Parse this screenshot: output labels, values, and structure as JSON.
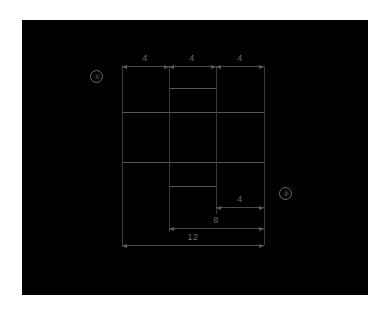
{
  "page": {
    "background": "#ffffff",
    "canvas_background": "#000000",
    "line_color": "#555555",
    "text_color": "#6a6a6a"
  },
  "drawing": {
    "title": "orthographic cross / plus shaped part outline",
    "units": "unitless",
    "shapes": [
      {
        "name": "horizontal-rectangle",
        "x": 100,
        "y": 92,
        "w": 142,
        "h": 50,
        "width_units": 12,
        "height_units": 4
      },
      {
        "name": "vertical-rectangle",
        "x": 147,
        "y": 68,
        "w": 47,
        "h": 98,
        "width_units": 4,
        "height_units": 8
      }
    ],
    "extension_lines": [
      {
        "name": "ext-left",
        "x": 100,
        "y1": 46,
        "y2": 225
      },
      {
        "name": "ext-mid-left",
        "x": 147,
        "y1": 46,
        "y2": 212
      },
      {
        "name": "ext-mid-right",
        "x": 194,
        "y1": 46,
        "y2": 194
      },
      {
        "name": "ext-right",
        "x": 242,
        "y1": 46,
        "y2": 225
      }
    ],
    "dimensions": [
      {
        "id": "top-seg-1",
        "label": "4",
        "value": 4,
        "orientation": "horizontal",
        "x1": 100,
        "x2": 147,
        "y": 46,
        "text_x": 123,
        "text_y": 33
      },
      {
        "id": "top-seg-2",
        "label": "4",
        "value": 4,
        "orientation": "horizontal",
        "x1": 147,
        "x2": 194,
        "y": 46,
        "text_x": 170,
        "text_y": 33
      },
      {
        "id": "top-seg-3",
        "label": "4",
        "value": 4,
        "orientation": "horizontal",
        "x1": 194,
        "x2": 242,
        "y": 46,
        "text_x": 218,
        "text_y": 33
      },
      {
        "id": "bottom-right-4",
        "label": "4",
        "value": 4,
        "orientation": "horizontal",
        "x1": 194,
        "x2": 242,
        "y": 187,
        "text_x": 218,
        "text_y": 174
      },
      {
        "id": "bottom-8",
        "label": "8",
        "value": 8,
        "orientation": "horizontal",
        "x1": 147,
        "x2": 242,
        "y": 208,
        "text_x": 194,
        "text_y": 195
      },
      {
        "id": "bottom-12",
        "label": "12",
        "value": 12,
        "orientation": "horizontal",
        "x1": 100,
        "x2": 242,
        "y": 225,
        "text_x": 171,
        "text_y": 212
      }
    ],
    "callouts": [
      {
        "id": "callout-1",
        "label": "①",
        "x": 68,
        "y": 50
      },
      {
        "id": "callout-2",
        "label": "②",
        "x": 257,
        "y": 167
      }
    ]
  }
}
